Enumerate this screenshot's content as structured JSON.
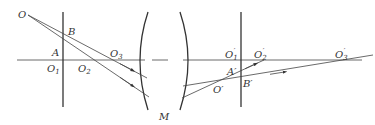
{
  "figure": {
    "type": "optical-ray-diagram",
    "labels": {
      "O": "O",
      "B": "B",
      "A": "A",
      "O1": "O",
      "O1_sub": "1",
      "O2": "O",
      "O2_sub": "2",
      "O3": "O",
      "O3_sub": "3",
      "M": "M",
      "O1p": "O",
      "O1p_sub": "1",
      "O2p": "O",
      "O2p_sub": "2",
      "O3p": "O",
      "O3p_sub": "3",
      "Ap": "A′",
      "Bp": "B′",
      "Op": "O′",
      "prime": "′"
    },
    "colors": {
      "line": "#444444",
      "text": "#333333",
      "background": "#ffffff"
    }
  }
}
